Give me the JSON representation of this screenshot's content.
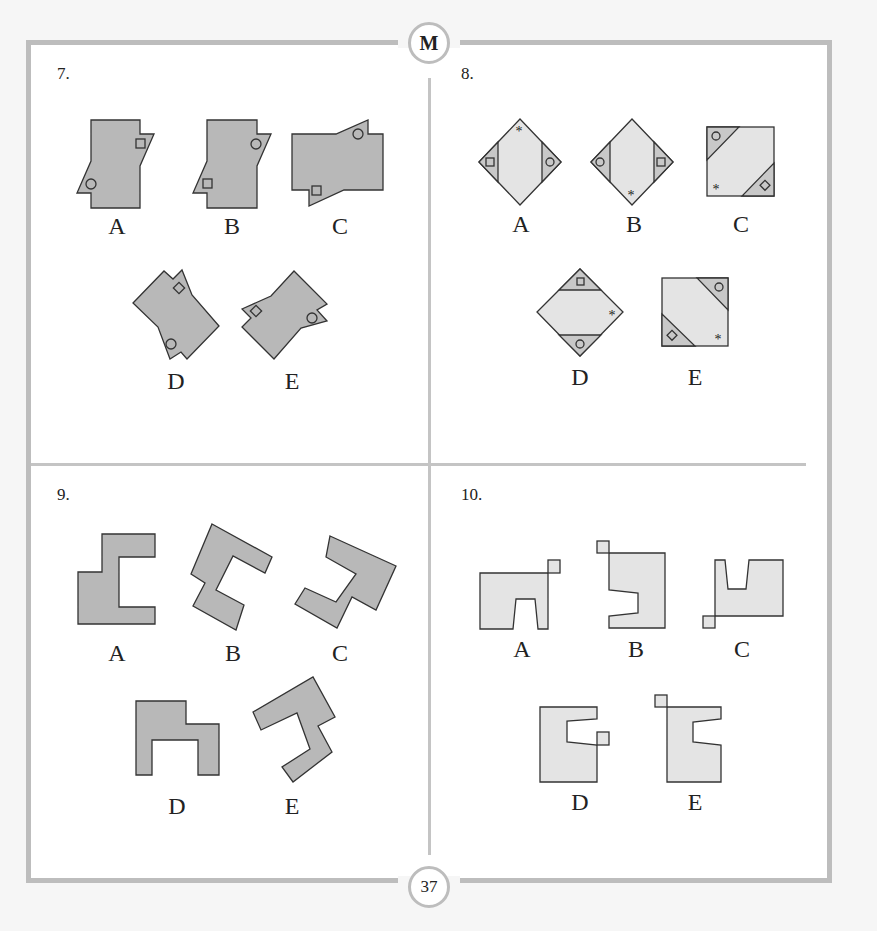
{
  "header": {
    "badge_letter": "M"
  },
  "footer": {
    "page_number": "37"
  },
  "questions": [
    {
      "number": "7.",
      "options": [
        "A",
        "B",
        "C",
        "D",
        "E"
      ],
      "figure": "hexagon-like shapes with circle and square markers, rotated/reflected"
    },
    {
      "number": "8.",
      "options": [
        "A",
        "B",
        "C",
        "D",
        "E"
      ],
      "figure": "squares/diamonds with shaded corner triangles containing square, circle, diamond and star markers"
    },
    {
      "number": "9.",
      "options": [
        "A",
        "B",
        "C",
        "D",
        "E"
      ],
      "figure": "grey bracket-shaped polygons in different orientations"
    },
    {
      "number": "10.",
      "options": [
        "A",
        "B",
        "C",
        "D",
        "E"
      ],
      "figure": "light grey notched polygons with attached small square"
    }
  ],
  "colors": {
    "frame": "#bdbdbd",
    "shape_dark": "#b8b8b8",
    "shape_light": "#e4e4e4",
    "shade": "#c8c8c8",
    "stroke": "#333333"
  }
}
